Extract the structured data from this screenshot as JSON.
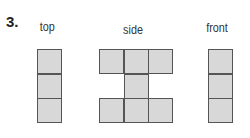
{
  "problem": {
    "number": "3."
  },
  "views": [
    {
      "label": "top",
      "cells": [
        [
          0,
          0
        ],
        [
          0,
          1
        ],
        [
          0,
          2
        ]
      ]
    },
    {
      "label": "side",
      "cells": [
        [
          0,
          0
        ],
        [
          1,
          0
        ],
        [
          2,
          0
        ],
        [
          1,
          1
        ],
        [
          0,
          2
        ],
        [
          1,
          2
        ],
        [
          2,
          2
        ]
      ]
    },
    {
      "label": "front",
      "cells": [
        [
          0,
          0
        ],
        [
          0,
          1
        ],
        [
          0,
          2
        ]
      ]
    }
  ],
  "colors": {
    "cell_fill": "#d8d8d8",
    "cell_border": "#555555"
  }
}
